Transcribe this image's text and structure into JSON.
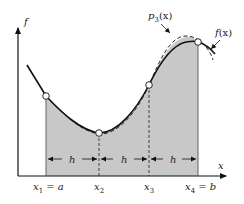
{
  "diagram": {
    "axes": {
      "y_label": "f",
      "x_label": "x"
    },
    "curves": {
      "f": {
        "label": "f(x)",
        "label_main": "f",
        "label_arg": "(x)",
        "style": "solid"
      },
      "p3": {
        "label": "p3(x)",
        "label_main": "p",
        "label_sub": "3",
        "label_arg": "(x)",
        "style": "dashed"
      }
    },
    "nodes": [
      {
        "id": "x1",
        "label_main": "x",
        "label_sub": "1",
        "label_suffix": " = a"
      },
      {
        "id": "x2",
        "label_main": "x",
        "label_sub": "2",
        "label_suffix": ""
      },
      {
        "id": "x3",
        "label_main": "x",
        "label_sub": "3",
        "label_suffix": ""
      },
      {
        "id": "x4",
        "label_main": "x",
        "label_sub": "4",
        "label_suffix": " = b"
      }
    ],
    "spacing": [
      {
        "label": "h"
      },
      {
        "label": "h"
      },
      {
        "label": "h"
      }
    ],
    "colors": {
      "shade": "#c8c8c8",
      "line": "#111111",
      "background": "#ffffff"
    }
  }
}
